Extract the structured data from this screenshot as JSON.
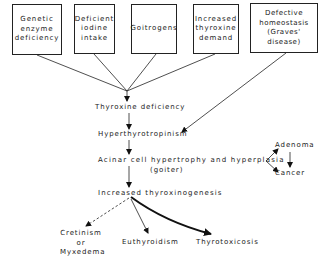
{
  "diagram": {
    "causes": [
      {
        "lines": [
          "Genetic",
          "enzyme",
          "deficiency"
        ]
      },
      {
        "lines": [
          "Deficient",
          "iodine",
          "intake"
        ]
      },
      {
        "lines": [
          "Goitrogens"
        ]
      },
      {
        "lines": [
          "Increased",
          "thyroxine",
          "demand"
        ]
      },
      {
        "lines": [
          "Defective",
          "homeostasis",
          "(Graves' disease)"
        ]
      }
    ],
    "nodes": {
      "thyroxine_deficiency": "Thyroxine deficiency",
      "hyperthyrotropinism": "Hyperthyrotropinism",
      "acinar": "Acinar cell hypertrophy and hyperplasia",
      "goiter": "(goiter)",
      "adenoma": "Adenoma",
      "cancer": "Cancer",
      "increased_thyroxinogenesis": "Increased thyroxinogenesis",
      "cretinism": "Cretinism",
      "or": "or",
      "myxedema": "Myxedema",
      "euthyroidism": "Euthyroidism",
      "thyrotoxicosis": "Thyrotoxicosis"
    },
    "edges": [
      {
        "from": "Genetic enzyme deficiency",
        "to": "Thyroxine deficiency",
        "style": "solid"
      },
      {
        "from": "Deficient iodine intake",
        "to": "Thyroxine deficiency",
        "style": "solid"
      },
      {
        "from": "Goitrogens",
        "to": "Thyroxine deficiency",
        "style": "solid"
      },
      {
        "from": "Increased thyroxine demand",
        "to": "Thyroxine deficiency",
        "style": "solid"
      },
      {
        "from": "Defective homeostasis (Graves' disease)",
        "to": "Hyperthyrotropinism",
        "style": "solid"
      },
      {
        "from": "Thyroxine deficiency",
        "to": "Hyperthyrotropinism",
        "style": "solid"
      },
      {
        "from": "Hyperthyrotropinism",
        "to": "Acinar cell hypertrophy and hyperplasia (goiter)",
        "style": "solid"
      },
      {
        "from": "Acinar cell hypertrophy and hyperplasia (goiter)",
        "to": "Adenoma",
        "style": "solid"
      },
      {
        "from": "Acinar cell hypertrophy and hyperplasia (goiter)",
        "to": "Cancer",
        "style": "solid"
      },
      {
        "from": "Adenoma",
        "to": "Cancer",
        "style": "solid"
      },
      {
        "from": "Acinar cell hypertrophy and hyperplasia (goiter)",
        "to": "Increased thyroxinogenesis",
        "style": "solid"
      },
      {
        "from": "Increased thyroxinogenesis",
        "to": "Cretinism or Myxedema",
        "style": "dashed"
      },
      {
        "from": "Increased thyroxinogenesis",
        "to": "Euthyroidism",
        "style": "solid"
      },
      {
        "from": "Increased thyroxinogenesis",
        "to": "Thyrotoxicosis",
        "style": "bold-curved"
      }
    ]
  }
}
